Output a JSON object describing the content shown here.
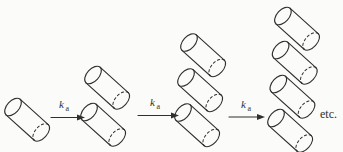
{
  "figure": {
    "background_color": "#fbfbf9",
    "ink_color": "#2f2f2f",
    "stages": [
      {
        "cylinder_count": 1
      },
      {
        "cylinder_count": 2
      },
      {
        "cylinder_count": 3
      },
      {
        "cylinder_count": 4
      }
    ],
    "arrows": [
      {
        "label_base": "k",
        "label_sub": "a"
      },
      {
        "label_base": "k",
        "label_sub": "a"
      },
      {
        "label_base": "k",
        "label_sub": "a"
      }
    ],
    "etc_label": "etc."
  }
}
